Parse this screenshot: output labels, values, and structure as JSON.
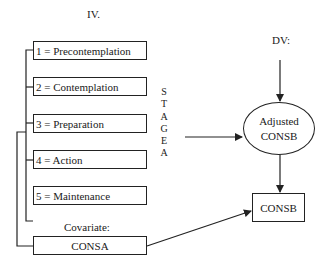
{
  "labels": {
    "iv": "IV.",
    "dv": "DV:",
    "covariate": "Covariate:"
  },
  "stages": [
    {
      "label": "1 = Precontemplation"
    },
    {
      "label": "2 = Contemplation"
    },
    {
      "label": "3 = Preparation"
    },
    {
      "label": "4 = Action"
    },
    {
      "label": "5 = Maintenance"
    }
  ],
  "stage_variable_letters": [
    "S",
    "T",
    "A",
    "G",
    "E",
    "A"
  ],
  "covariate_box": "CONSA",
  "ellipse": {
    "line1": "Adjusted",
    "line2": "CONSB"
  },
  "outcome_box": "CONSB",
  "colors": {
    "line": "#222222",
    "background": "#ffffff"
  }
}
